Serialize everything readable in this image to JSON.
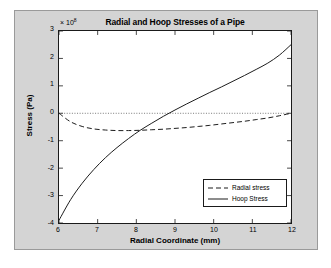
{
  "figure": {
    "background_color": "#d4d4d4",
    "plot_background_color": "#ffffff",
    "border_color": "#9a9a9a"
  },
  "chart_data": {
    "type": "line",
    "title": "Radial and Hoop Stresses of a Pipe",
    "xlabel": "Radial Coordinate (mm)",
    "ylabel": "Stress (Pa)",
    "exponent_prefix": "× 10",
    "exponent_power": "8",
    "exponent_value": 100000000,
    "xlim": [
      6,
      12
    ],
    "ylim": [
      -4,
      3
    ],
    "xticks": [
      6,
      7,
      8,
      9,
      10,
      11,
      12
    ],
    "yticks": [
      3,
      2,
      1,
      0,
      -1,
      -2,
      -3,
      -4
    ],
    "xtick_labels": [
      "6",
      "7",
      "8",
      "9",
      "10",
      "11",
      "12"
    ],
    "ytick_labels": [
      "3",
      "2",
      "1",
      "0",
      "-1",
      "-2",
      "-3",
      "-4"
    ],
    "grid": false,
    "zero_reference_line": true,
    "zero_reference_style": "dotted",
    "legend_position": "lower right",
    "x": [
      6.0,
      6.3,
      6.6,
      6.9,
      7.2,
      7.5,
      7.8,
      8.1,
      8.4,
      8.7,
      9.0,
      9.3,
      9.6,
      9.9,
      10.2,
      10.5,
      10.8,
      11.1,
      11.4,
      11.7,
      12.0
    ],
    "series": [
      {
        "name": "Radial stress",
        "style": "dashed",
        "color": "#1a1a1a",
        "values": [
          0.0,
          -0.31,
          -0.48,
          -0.57,
          -0.61,
          -0.63,
          -0.63,
          -0.62,
          -0.6,
          -0.58,
          -0.55,
          -0.52,
          -0.48,
          -0.44,
          -0.39,
          -0.34,
          -0.29,
          -0.23,
          -0.17,
          -0.09,
          0.0
        ]
      },
      {
        "name": "Hoop Stress",
        "style": "solid",
        "color": "#1a1a1a",
        "values": [
          -3.9,
          -3.15,
          -2.55,
          -2.05,
          -1.62,
          -1.25,
          -0.92,
          -0.62,
          -0.36,
          -0.11,
          0.12,
          0.34,
          0.55,
          0.76,
          0.96,
          1.17,
          1.38,
          1.6,
          1.83,
          2.12,
          2.5
        ]
      }
    ]
  },
  "legend": {
    "items": [
      {
        "label": "Radial stress",
        "style": "dashed"
      },
      {
        "label": "Hoop Stress",
        "style": "solid"
      }
    ]
  }
}
